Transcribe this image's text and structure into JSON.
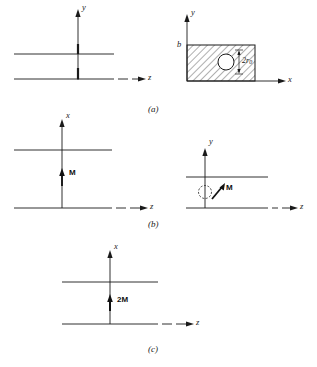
{
  "figure": {
    "background_color": "#ffffff",
    "line_color": "#1a1a1a",
    "hatch_color": "#2b2b2b",
    "panels": [
      {
        "id": "a",
        "caption": "(a)",
        "left_view": {
          "vertical_axis_label": "y",
          "horizontal_axis_label": "z",
          "description": "two horizontal parallel plates with vertical y axis and horizontal z axis"
        },
        "right_view": {
          "vertical_axis_label": "y",
          "horizontal_axis_label": "x",
          "height_label": "b",
          "hole_label": "2r",
          "hole_label_sub": "0",
          "description": "hatched rectangular cross section of height b containing a circular hole of diameter 2r0"
        }
      },
      {
        "id": "b",
        "caption": "(b)",
        "left_view": {
          "vertical_axis_label": "x",
          "horizontal_axis_label": "z",
          "magnetization_label": "M",
          "description": "two parallel plates with upward magnetization vector M between them"
        },
        "right_view": {
          "vertical_axis_label": "y",
          "horizontal_axis_label": "z",
          "magnetization_label": "M",
          "description": "two parallel plates with dashed circular hole and tilted magnetization vector M"
        }
      },
      {
        "id": "c",
        "caption": "(c)",
        "view": {
          "vertical_axis_label": "x",
          "horizontal_axis_label": "z",
          "magnetization_label": "2M",
          "description": "two parallel plates with upward magnetization vector of magnitude 2M between them"
        }
      }
    ]
  }
}
